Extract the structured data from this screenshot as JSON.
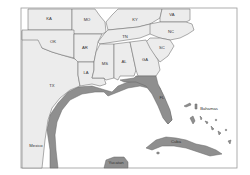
{
  "map": {
    "colors": {
      "land": "#ececec",
      "highlight": "#8f8f8f",
      "border": "#6a6a6a",
      "water": "#ffffff"
    },
    "labels": {
      "KA": "KA",
      "MO": "MO",
      "KY": "KY",
      "VA": "VA",
      "OK": "OK",
      "AR": "AR",
      "TN": "TN",
      "NC": "NC",
      "SC": "SC",
      "MS": "MS",
      "AL": "AL",
      "GA": "GA",
      "LA": "LA",
      "TX": "TX",
      "FL": "FL",
      "Bahamas": "Bahamas",
      "Mexico": "Mexico",
      "Cuba": "Cuba",
      "Yucatan": "Yucatan"
    }
  }
}
